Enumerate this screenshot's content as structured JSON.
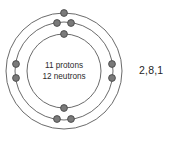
{
  "diagram": {
    "type": "bohr-atom-model",
    "element_implied": "Sodium",
    "nucleus": {
      "protons_label": "11 protons",
      "neutrons_label": "12 neutrons",
      "protons": 11,
      "neutrons": 12
    },
    "electron_configuration_label": "2,8,1",
    "shells": [
      {
        "name": "inner-shell",
        "index": 1,
        "electron_count": 2,
        "radius": 37
      },
      {
        "name": "middle-shell",
        "index": 2,
        "electron_count": 8,
        "radius": 49
      },
      {
        "name": "outer-shell",
        "index": 3,
        "electron_count": 1,
        "radius": 58
      }
    ],
    "center": {
      "x": 64,
      "y": 71
    },
    "colors": {
      "ring_stroke": "#6b6b6b",
      "electron_fill": "#7a7a7a",
      "electron_stroke": "#4a4a4a",
      "text": "#2b2b2b",
      "background": "#ffffff"
    },
    "electrons": [
      {
        "shell": 1,
        "x": 64,
        "y": 34
      },
      {
        "shell": 1,
        "x": 64,
        "y": 108
      },
      {
        "shell": 2,
        "x": 57,
        "y": 23
      },
      {
        "shell": 2,
        "x": 71,
        "y": 23
      },
      {
        "shell": 2,
        "x": 57,
        "y": 119
      },
      {
        "shell": 2,
        "x": 71,
        "y": 119
      },
      {
        "shell": 2,
        "x": 16,
        "y": 78
      },
      {
        "shell": 2,
        "x": 112,
        "y": 78
      },
      {
        "shell": 2,
        "x": 16,
        "y": 64
      },
      {
        "shell": 2,
        "x": 112,
        "y": 64
      },
      {
        "shell": 3,
        "x": 64,
        "y": 13
      }
    ]
  }
}
